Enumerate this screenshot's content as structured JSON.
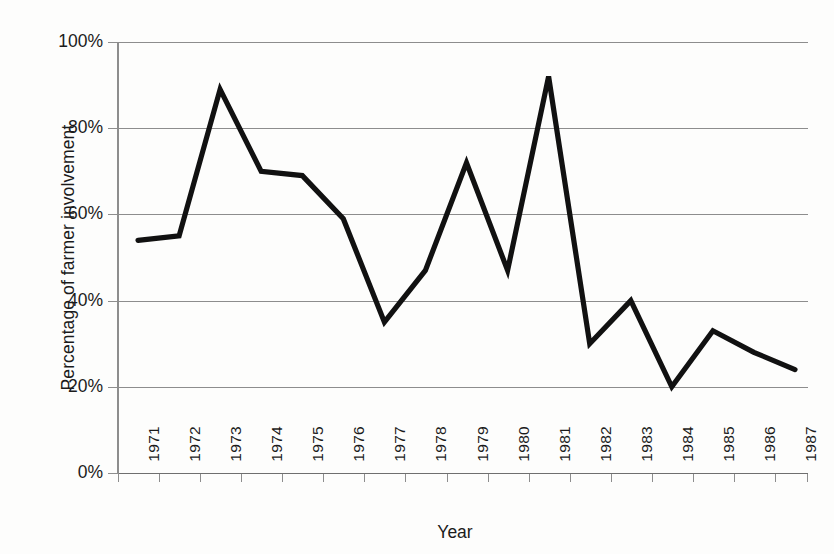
{
  "chart_data": {
    "type": "line",
    "title": "",
    "xlabel": "Year",
    "ylabel": "Percentage of farmer involvement",
    "categories": [
      "1971",
      "1972",
      "1973",
      "1974",
      "1975",
      "1976",
      "1977",
      "1978",
      "1979",
      "1980",
      "1981",
      "1982",
      "1983",
      "1984",
      "1985",
      "1986",
      "1987"
    ],
    "values": [
      54,
      55,
      89,
      70,
      69,
      59,
      35,
      47,
      72,
      47,
      92,
      30,
      40,
      20,
      33,
      28,
      24
    ],
    "series": [
      {
        "name": "Percentage of farmer involvement",
        "values": [
          54,
          55,
          89,
          70,
          69,
          59,
          35,
          47,
          72,
          47,
          92,
          30,
          40,
          20,
          33,
          28,
          24
        ]
      }
    ],
    "ylim": [
      0,
      100
    ],
    "ytick_labels": [
      "100%",
      "80%",
      "60%",
      "40%",
      "20%",
      "0%"
    ],
    "ytick_values": [
      100,
      80,
      60,
      40,
      20,
      0
    ],
    "grid": "horizontal",
    "legend": "none",
    "line_color": "#111111",
    "grid_color": "#8d8d8d",
    "background_color": "#fdfdfc"
  },
  "axes": {
    "y_title": "Percentage of farmer involvement",
    "x_title": "Year"
  }
}
